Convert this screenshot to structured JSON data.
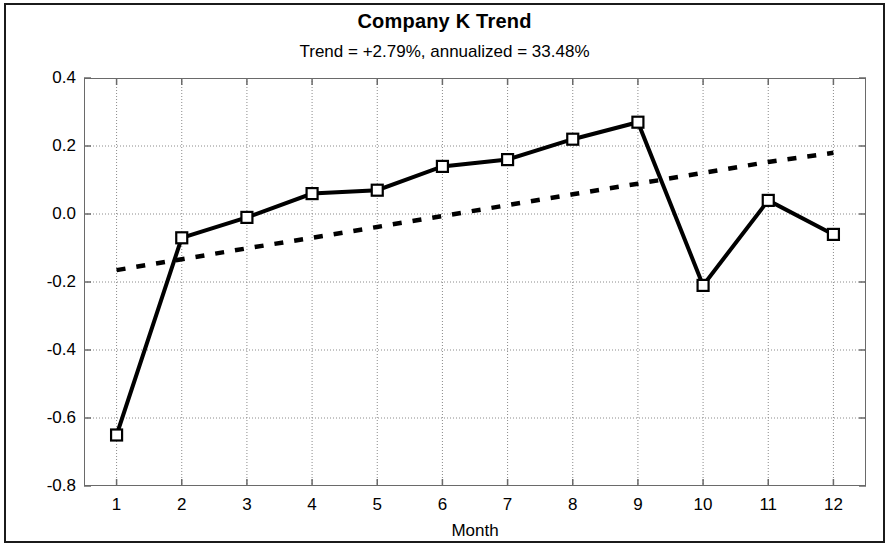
{
  "chart_data": {
    "type": "line",
    "title": "Company K Trend",
    "subtitle": "Trend = +2.79%,  annualized = 33.48%",
    "xlabel": "Month",
    "ylabel": "Z Score",
    "xlim": [
      0.5,
      12.5
    ],
    "ylim": [
      -0.8,
      0.4
    ],
    "grid": true,
    "legend": null,
    "x": [
      1,
      2,
      3,
      4,
      5,
      6,
      7,
      8,
      9,
      10,
      11,
      12
    ],
    "xticklabels": [
      "1",
      "2",
      "3",
      "4",
      "5",
      "6",
      "7",
      "8",
      "9",
      "10",
      "11",
      "12"
    ],
    "yticks": [
      0.4,
      0.2,
      0.0,
      -0.2,
      -0.4,
      -0.6,
      -0.8
    ],
    "yticklabels": [
      "0.4",
      "0.2",
      "0.0",
      "-0.2",
      "-0.4",
      "-0.6",
      "-0.8"
    ],
    "series": [
      {
        "name": "Z Score",
        "style": "solid",
        "marker": "open-square",
        "color": "#000000",
        "values": [
          -0.65,
          -0.07,
          -0.01,
          0.06,
          0.07,
          0.14,
          0.16,
          0.22,
          0.27,
          -0.21,
          0.04,
          -0.06
        ]
      },
      {
        "name": "Trend",
        "style": "dashed",
        "marker": "none",
        "color": "#000000",
        "values": [
          -0.165,
          -0.133,
          -0.101,
          -0.07,
          -0.038,
          -0.006,
          0.026,
          0.058,
          0.089,
          0.121,
          0.153,
          0.18
        ]
      }
    ]
  },
  "figure": {
    "background_color": "#ffffff",
    "border_color": "#1b1b1b",
    "axis_color": "#6a6a6a",
    "gridline_color": "#8a8a8a"
  }
}
